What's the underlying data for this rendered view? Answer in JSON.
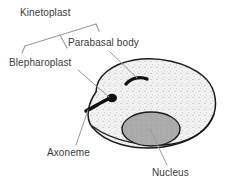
{
  "figure": {
    "background_color": "#ffffff",
    "width": 229,
    "height": 188
  },
  "labels": {
    "kinetoplast": "Kinetoplast",
    "parabasal_body": "Parabasal body",
    "blepharoplast": "Blepharoplast",
    "axoneme": "Axoneme",
    "nucleus": "Nucleus"
  },
  "colors": {
    "text": "#3a3a3a",
    "outline": "#1a1a1a",
    "leader": "#8e8e8e",
    "cytoplasm": "#f2f2f2",
    "stipple": "#b9b9b9",
    "nucleus_fill": "#a9a9a9",
    "organelle": "#111111"
  },
  "structures": [
    {
      "name": "cell-body",
      "fill": "stippled light gray",
      "outline": "dark"
    },
    {
      "name": "nucleus",
      "fill": "medium gray ellipse",
      "outline": "dark"
    },
    {
      "name": "parabasal-body",
      "fill": "black crescent",
      "outline": "none"
    },
    {
      "name": "blepharoplast",
      "fill": "black oval blob",
      "outline": "none"
    },
    {
      "name": "axoneme",
      "fill": "black tapering line",
      "outline": "none"
    }
  ],
  "annotations": {
    "kinetoplast_bracket": "slanted bracket spanning blepharoplast and parabasal body labels",
    "leader_lines": 4
  }
}
